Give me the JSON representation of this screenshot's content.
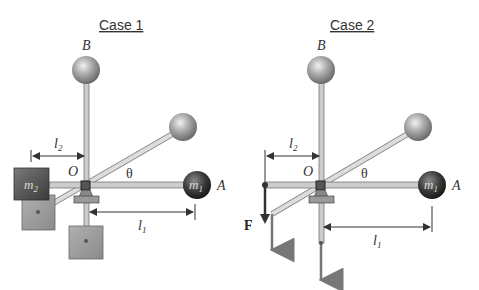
{
  "case1": {
    "title": "Case 1",
    "label_B": "B",
    "label_O": "O",
    "label_A": "A",
    "label_theta": "θ",
    "label_m1": "m",
    "label_m1_sub": "1",
    "label_m2": "m",
    "label_m2_sub": "2",
    "label_l1": "l",
    "label_l1_sub": "1",
    "label_l2": "l",
    "label_l2_sub": "2"
  },
  "case2": {
    "title": "Case 2",
    "label_B": "B",
    "label_O": "O",
    "label_A": "A",
    "label_theta": "θ",
    "label_m1": "m",
    "label_m1_sub": "1",
    "label_F": "F",
    "label_l1": "l",
    "label_l1_sub": "1",
    "label_l2": "l",
    "label_l2_sub": "2"
  }
}
